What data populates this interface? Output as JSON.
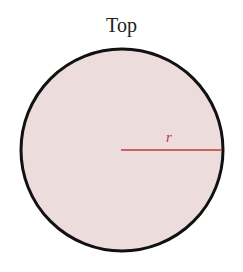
{
  "diagram": {
    "title": "Top",
    "radius_label": "r",
    "colors": {
      "fill": "#ecdcdc",
      "outline": "#111111",
      "radius_line": "#c0393b",
      "radius_label": "#b83a3a"
    },
    "circle": {
      "cx": 122,
      "cy": 150,
      "r": 101
    }
  }
}
